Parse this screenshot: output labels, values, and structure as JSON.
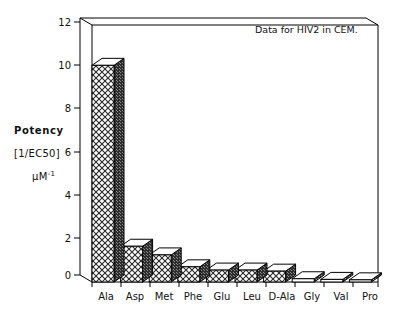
{
  "chart_data": {
    "type": "bar",
    "title": "",
    "annotation": "Data for HIV2 in CEM.",
    "xlabel": "",
    "ylabel_lines": [
      "Potency",
      "[1/EC50]",
      "µM⁻¹"
    ],
    "ylabel": "Potency [1/EC50] µM-1",
    "categories": [
      "Ala",
      "Asp",
      "Met",
      "Phe",
      "Glu",
      "Leu",
      "D-Ala",
      "Gly",
      "Val",
      "Pro"
    ],
    "values": [
      10.0,
      1.65,
      1.25,
      0.7,
      0.55,
      0.55,
      0.5,
      0.15,
      0.12,
      0.1
    ],
    "ylim": [
      0,
      12
    ],
    "yticks": [
      0,
      2,
      4,
      6,
      8,
      10,
      12
    ],
    "ytick_labels": [
      "0",
      "2",
      "4",
      "6",
      "8",
      "10",
      "12"
    ],
    "grid": false,
    "legend": "none",
    "style": "3d-bars-hatched",
    "colors": {
      "front_face": "#ffffff",
      "hatch": "#333333",
      "side_face": "#3a3a3a",
      "top_face": "#ffffff",
      "outline": "#000000",
      "axis": "#000000",
      "background": "#ffffff"
    }
  },
  "axes": {
    "y_tick_0": "0",
    "y_tick_2": "2",
    "y_tick_4": "4",
    "y_tick_6": "6",
    "y_tick_8": "8",
    "y_tick_10": "10",
    "y_tick_12": "12"
  },
  "ylabel": {
    "line1": "Potency",
    "line2": "[1/EC50]",
    "line3_base": "µM",
    "line3_sup": "-1"
  },
  "xlabels": {
    "c0": "Ala",
    "c1": "Asp",
    "c2": "Met",
    "c3": "Phe",
    "c4": "Glu",
    "c5": "Leu",
    "c6": "D-Ala",
    "c7": "Gly",
    "c8": "Val",
    "c9": "Pro"
  },
  "annotation": {
    "text": "Data for HIV2 in CEM."
  }
}
